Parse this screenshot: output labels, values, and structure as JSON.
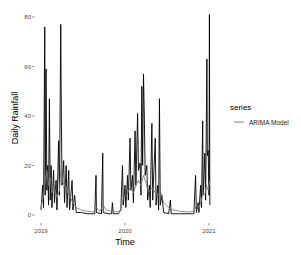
{
  "chart_data": {
    "type": "line",
    "title": "",
    "xlabel": "Time",
    "ylabel": "Daily Rainfall",
    "ylim": [
      0,
      82
    ],
    "xlim": [
      "2019-01-01",
      "2021-01-05"
    ],
    "grid": false,
    "legend_position": "right",
    "legend_title": "series",
    "x_ticks": [
      "2019",
      "2020",
      "2021"
    ],
    "y_ticks": [
      0,
      20,
      40,
      60,
      80
    ],
    "series": [
      {
        "name": "Observed",
        "color": "#000000",
        "in_legend": false,
        "points": [
          [
            2019.0,
            2
          ],
          [
            2019.02,
            12
          ],
          [
            2019.03,
            3
          ],
          [
            2019.045,
            76
          ],
          [
            2019.05,
            8
          ],
          [
            2019.06,
            59
          ],
          [
            2019.07,
            10
          ],
          [
            2019.08,
            20
          ],
          [
            2019.09,
            4
          ],
          [
            2019.1,
            47
          ],
          [
            2019.11,
            6
          ],
          [
            2019.12,
            20
          ],
          [
            2019.13,
            3
          ],
          [
            2019.15,
            18
          ],
          [
            2019.16,
            5
          ],
          [
            2019.18,
            14
          ],
          [
            2019.19,
            2
          ],
          [
            2019.21,
            30
          ],
          [
            2019.22,
            8
          ],
          [
            2019.235,
            77
          ],
          [
            2019.24,
            50
          ],
          [
            2019.25,
            12
          ],
          [
            2019.27,
            22
          ],
          [
            2019.28,
            5
          ],
          [
            2019.3,
            20
          ],
          [
            2019.31,
            3
          ],
          [
            2019.33,
            18
          ],
          [
            2019.34,
            2
          ],
          [
            2019.37,
            14
          ],
          [
            2019.38,
            2
          ],
          [
            2019.4,
            8
          ],
          [
            2019.42,
            1
          ],
          [
            2019.48,
            1
          ],
          [
            2019.55,
            0.5
          ],
          [
            2019.64,
            0.5
          ],
          [
            2019.655,
            16
          ],
          [
            2019.66,
            1
          ],
          [
            2019.72,
            0.5
          ],
          [
            2019.735,
            25
          ],
          [
            2019.74,
            1
          ],
          [
            2019.8,
            0.5
          ],
          [
            2019.84,
            0.5
          ],
          [
            2019.85,
            5
          ],
          [
            2019.86,
            0.5
          ],
          [
            2019.92,
            0.5
          ],
          [
            2019.95,
            2
          ],
          [
            2019.97,
            20
          ],
          [
            2019.98,
            4
          ],
          [
            2020.0,
            12
          ],
          [
            2020.01,
            3
          ],
          [
            2020.03,
            16
          ],
          [
            2020.04,
            6
          ],
          [
            2020.06,
            31
          ],
          [
            2020.07,
            10
          ],
          [
            2020.09,
            16
          ],
          [
            2020.1,
            5
          ],
          [
            2020.12,
            34
          ],
          [
            2020.13,
            12
          ],
          [
            2020.15,
            41
          ],
          [
            2020.16,
            18
          ],
          [
            2020.18,
            21
          ],
          [
            2020.19,
            8
          ],
          [
            2020.2,
            52
          ],
          [
            2020.21,
            20
          ],
          [
            2020.22,
            57
          ],
          [
            2020.23,
            40
          ],
          [
            2020.24,
            16
          ],
          [
            2020.26,
            20
          ],
          [
            2020.27,
            6
          ],
          [
            2020.29,
            12
          ],
          [
            2020.3,
            3
          ],
          [
            2020.32,
            37
          ],
          [
            2020.33,
            6
          ],
          [
            2020.36,
            31
          ],
          [
            2020.37,
            4
          ],
          [
            2020.39,
            12
          ],
          [
            2020.4,
            2
          ],
          [
            2020.41,
            47
          ],
          [
            2020.42,
            4
          ],
          [
            2020.44,
            8
          ],
          [
            2020.46,
            1
          ],
          [
            2020.52,
            0.5
          ],
          [
            2020.54,
            6
          ],
          [
            2020.55,
            0.5
          ],
          [
            2020.65,
            0.5
          ],
          [
            2020.75,
            0.5
          ],
          [
            2020.82,
            0.5
          ],
          [
            2020.84,
            16
          ],
          [
            2020.85,
            1
          ],
          [
            2020.87,
            5
          ],
          [
            2020.88,
            1
          ],
          [
            2020.9,
            12
          ],
          [
            2020.91,
            3
          ],
          [
            2020.925,
            38
          ],
          [
            2020.93,
            8
          ],
          [
            2020.94,
            16
          ],
          [
            2020.95,
            25
          ],
          [
            2020.96,
            6
          ],
          [
            2020.975,
            63
          ],
          [
            2020.98,
            24
          ],
          [
            2020.99,
            26
          ],
          [
            2021.0,
            8
          ],
          [
            2021.005,
            81
          ],
          [
            2021.01,
            4
          ]
        ]
      },
      {
        "name": "ARIMA Model",
        "color": "#808080",
        "in_legend": true,
        "points": [
          [
            2019.0,
            3
          ],
          [
            2019.03,
            8
          ],
          [
            2019.05,
            14
          ],
          [
            2019.07,
            18
          ],
          [
            2019.09,
            12
          ],
          [
            2019.11,
            15
          ],
          [
            2019.13,
            9
          ],
          [
            2019.16,
            11
          ],
          [
            2019.19,
            7
          ],
          [
            2019.22,
            10
          ],
          [
            2019.24,
            20
          ],
          [
            2019.26,
            13
          ],
          [
            2019.29,
            12
          ],
          [
            2019.32,
            9
          ],
          [
            2019.35,
            7
          ],
          [
            2019.38,
            5
          ],
          [
            2019.42,
            3
          ],
          [
            2019.48,
            2
          ],
          [
            2019.55,
            1.5
          ],
          [
            2019.62,
            1.2
          ],
          [
            2019.66,
            3
          ],
          [
            2019.7,
            1.5
          ],
          [
            2019.74,
            4
          ],
          [
            2019.78,
            2
          ],
          [
            2019.84,
            1.5
          ],
          [
            2019.9,
            1.2
          ],
          [
            2019.95,
            2
          ],
          [
            2019.98,
            7
          ],
          [
            2020.02,
            8
          ],
          [
            2020.06,
            11
          ],
          [
            2020.1,
            9
          ],
          [
            2020.13,
            12
          ],
          [
            2020.16,
            14
          ],
          [
            2020.19,
            12
          ],
          [
            2020.22,
            16
          ],
          [
            2020.25,
            13
          ],
          [
            2020.28,
            9
          ],
          [
            2020.32,
            11
          ],
          [
            2020.36,
            9
          ],
          [
            2020.4,
            8
          ],
          [
            2020.42,
            10
          ],
          [
            2020.46,
            5
          ],
          [
            2020.52,
            3
          ],
          [
            2020.58,
            2
          ],
          [
            2020.65,
            1.5
          ],
          [
            2020.75,
            1.2
          ],
          [
            2020.82,
            1.5
          ],
          [
            2020.85,
            4
          ],
          [
            2020.88,
            3
          ],
          [
            2020.91,
            6
          ],
          [
            2020.93,
            9
          ],
          [
            2020.95,
            8
          ],
          [
            2020.97,
            12
          ],
          [
            2020.99,
            10
          ],
          [
            2021.01,
            14
          ]
        ]
      }
    ]
  }
}
